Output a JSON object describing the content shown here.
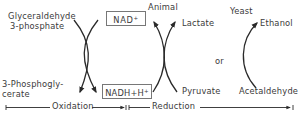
{
  "diagram": {
    "oxidation": {
      "substrate": {
        "line1": "Glyceraldehyde",
        "line2": "3-phosphate"
      },
      "product": {
        "line1": "3-Phosphogly-",
        "line2": "cerate"
      }
    },
    "cofactors": {
      "oxidized": {
        "text": "NAD",
        "sup": "+"
      },
      "reduced": {
        "text": "NADH+H",
        "sup": "+"
      }
    },
    "animal_branch": {
      "organism": "Animal",
      "product": "Lactate",
      "substrate": "Pyruvate"
    },
    "separator": "or",
    "yeast_branch": {
      "organism": "Yeast",
      "product": "Ethanol",
      "substrate": "Acetaldehyde"
    },
    "scale": {
      "left_label": "Oxidation",
      "right_label": "Reduction"
    },
    "colors": {
      "line": "#2a2a2a",
      "text": "#3a3a3a",
      "box_border": "#777777"
    }
  }
}
